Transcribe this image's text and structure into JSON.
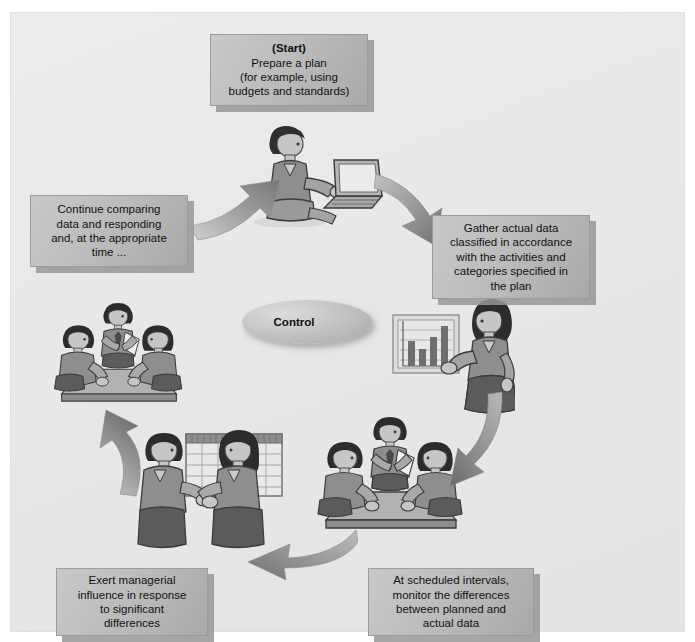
{
  "diagram": {
    "center": {
      "label": "Control"
    },
    "background_color": "#e8e8e9",
    "box_color": "#b9b9ba",
    "arrow_color": "#9a9a9c",
    "steps": [
      {
        "id": "start",
        "lines": [
          "(Start)",
          "Prepare a plan",
          "(for example, using",
          "budgets and standards)"
        ],
        "illustration": "person-at-laptop"
      },
      {
        "id": "gather",
        "lines": [
          "Gather actual data",
          "classified in accordance",
          "with the activities and",
          "categories specified in",
          "the plan"
        ],
        "illustration": "woman-presenting-bar-chart"
      },
      {
        "id": "monitor",
        "lines": [
          "At scheduled intervals,",
          "monitor the differences",
          "between planned and",
          "actual data"
        ],
        "illustration": "meeting-around-table"
      },
      {
        "id": "exert",
        "lines": [
          "Exert managerial",
          "influence in response",
          "to significant",
          "differences"
        ],
        "illustration": "two-people-at-spreadsheet"
      },
      {
        "id": "continue",
        "lines": [
          "Continue comparing",
          "data and responding",
          "and, at the appropriate",
          "time ..."
        ],
        "illustration": "meeting-around-table"
      }
    ],
    "arrows": [
      {
        "id": "arrow-continue-to-start",
        "direction": "up-right"
      },
      {
        "id": "arrow-start-to-gather",
        "direction": "down-right"
      },
      {
        "id": "arrow-gather-to-monitor",
        "direction": "down-left"
      },
      {
        "id": "arrow-monitor-to-exert",
        "direction": "left"
      },
      {
        "id": "arrow-exert-to-continue",
        "direction": "up"
      }
    ]
  }
}
